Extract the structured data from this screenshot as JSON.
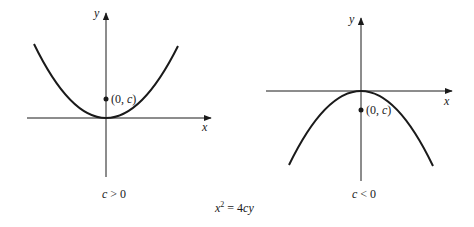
{
  "figure": {
    "equation": "x² = 4cy",
    "equation_parts": {
      "x": "x",
      "exp": "2",
      "rest": " = 4",
      "c": "c",
      "y": "y"
    },
    "panels": [
      {
        "id": "left",
        "axis_x_label": "x",
        "axis_y_label": "y",
        "point_label_open": "(0, ",
        "point_label_var": "c",
        "point_label_close": ")",
        "caption_var": "c",
        "caption_rel": " > 0",
        "opens": "up"
      },
      {
        "id": "right",
        "axis_x_label": "x",
        "axis_y_label": "y",
        "point_label_open": "(0, ",
        "point_label_var": "c",
        "point_label_close": ")",
        "caption_var": "c",
        "caption_rel": " < 0",
        "opens": "down"
      }
    ]
  },
  "colors": {
    "ink": "#1a1a1a",
    "background": "#ffffff"
  }
}
